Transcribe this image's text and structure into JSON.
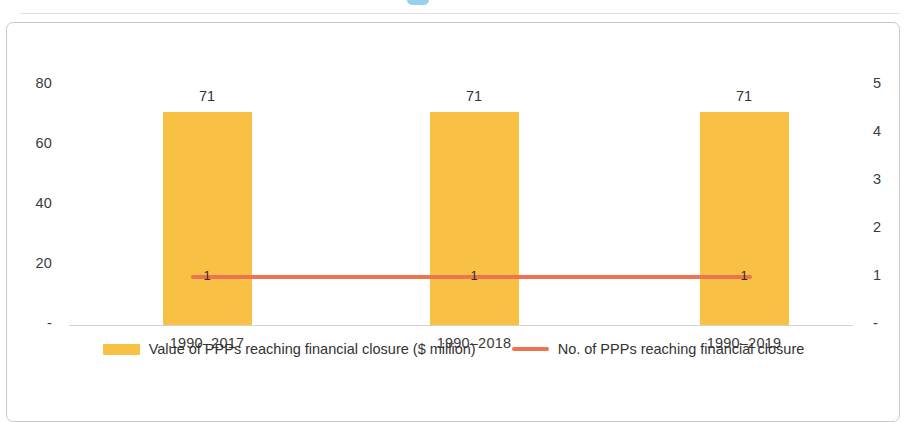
{
  "chart_data": {
    "type": "bar",
    "title": "",
    "subtitle": "",
    "xlabel": "",
    "ylabel": "",
    "categories": [
      "1990–2017",
      "1990–2018",
      "1990–2019"
    ],
    "series": [
      {
        "name": "Value of PPPs reaching financial closure ($ million)",
        "type": "bar",
        "axis": "left",
        "values": [
          71,
          71,
          71
        ],
        "value_labels": [
          "71",
          "71",
          "71"
        ],
        "color": "#f8c144"
      },
      {
        "name": "No. of PPPs reaching financial closure",
        "type": "line",
        "axis": "right",
        "values": [
          1,
          1,
          1
        ],
        "value_labels": [
          "1",
          "1",
          "1"
        ],
        "color": "#ee7352"
      }
    ],
    "left_axis": {
      "ticks": [
        "80",
        "60",
        "40",
        "20",
        "-"
      ],
      "tick_values": [
        80,
        60,
        40,
        20,
        0
      ],
      "ylim": [
        0,
        80
      ]
    },
    "right_axis": {
      "ticks": [
        "5",
        "4",
        "3",
        "2",
        "1",
        "-"
      ],
      "tick_values": [
        5,
        4,
        3,
        2,
        1,
        0
      ],
      "ylim": [
        0,
        5
      ]
    },
    "grid": false,
    "legend_position": "bottom"
  },
  "legend": {
    "items": [
      {
        "label": "Value of PPPs reaching financial closure ($ million)",
        "swatch": "bar-swatch"
      },
      {
        "label": "No. of PPPs reaching financial closure",
        "swatch": "line-swatch"
      }
    ]
  }
}
